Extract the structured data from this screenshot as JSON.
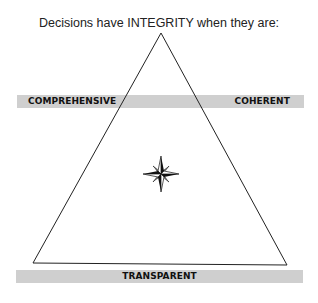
{
  "diagram": {
    "title": "Decisions have INTEGRITY when they are:",
    "labels": {
      "top_left": "COMPREHENSIVE",
      "top_right": "COHERENT",
      "bottom": "TRANSPARENT"
    },
    "center_icon": "compass-rose-icon",
    "colors": {
      "bar": "#cfcfcf",
      "line": "#222222",
      "text": "#111111"
    }
  }
}
